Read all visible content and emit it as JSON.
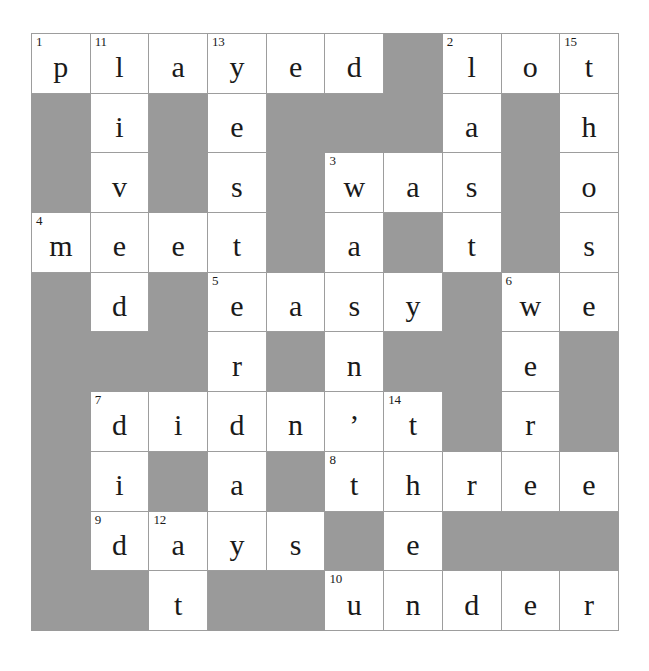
{
  "puzzle": {
    "type": "crossword-grid",
    "rows": 10,
    "cols": 10,
    "colors": {
      "block": "#9a9a9a",
      "cell": "#ffffff",
      "grid_line": "#9d9d9d",
      "text": "#1a1a1a"
    },
    "grid": [
      [
        {
          "block": false,
          "number": "1",
          "letter": "p"
        },
        {
          "block": false,
          "number": "11",
          "letter": "l"
        },
        {
          "block": false,
          "number": "",
          "letter": "a"
        },
        {
          "block": false,
          "number": "13",
          "letter": "y"
        },
        {
          "block": false,
          "number": "",
          "letter": "e"
        },
        {
          "block": false,
          "number": "",
          "letter": "d"
        },
        {
          "block": true,
          "number": "",
          "letter": ""
        },
        {
          "block": false,
          "number": "2",
          "letter": "l"
        },
        {
          "block": false,
          "number": "",
          "letter": "o"
        },
        {
          "block": false,
          "number": "15",
          "letter": "t"
        }
      ],
      [
        {
          "block": true,
          "number": "",
          "letter": ""
        },
        {
          "block": false,
          "number": "",
          "letter": "i"
        },
        {
          "block": true,
          "number": "",
          "letter": ""
        },
        {
          "block": false,
          "number": "",
          "letter": "e"
        },
        {
          "block": true,
          "number": "",
          "letter": ""
        },
        {
          "block": true,
          "number": "",
          "letter": ""
        },
        {
          "block": true,
          "number": "",
          "letter": ""
        },
        {
          "block": false,
          "number": "",
          "letter": "a"
        },
        {
          "block": true,
          "number": "",
          "letter": ""
        },
        {
          "block": false,
          "number": "",
          "letter": "h"
        }
      ],
      [
        {
          "block": true,
          "number": "",
          "letter": ""
        },
        {
          "block": false,
          "number": "",
          "letter": "v"
        },
        {
          "block": true,
          "number": "",
          "letter": ""
        },
        {
          "block": false,
          "number": "",
          "letter": "s"
        },
        {
          "block": true,
          "number": "",
          "letter": ""
        },
        {
          "block": false,
          "number": "3",
          "letter": "w"
        },
        {
          "block": false,
          "number": "",
          "letter": "a"
        },
        {
          "block": false,
          "number": "",
          "letter": "s"
        },
        {
          "block": true,
          "number": "",
          "letter": ""
        },
        {
          "block": false,
          "number": "",
          "letter": "o"
        }
      ],
      [
        {
          "block": false,
          "number": "4",
          "letter": "m"
        },
        {
          "block": false,
          "number": "",
          "letter": "e"
        },
        {
          "block": false,
          "number": "",
          "letter": "e"
        },
        {
          "block": false,
          "number": "",
          "letter": "t"
        },
        {
          "block": true,
          "number": "",
          "letter": ""
        },
        {
          "block": false,
          "number": "",
          "letter": "a"
        },
        {
          "block": true,
          "number": "",
          "letter": ""
        },
        {
          "block": false,
          "number": "",
          "letter": "t"
        },
        {
          "block": true,
          "number": "",
          "letter": ""
        },
        {
          "block": false,
          "number": "",
          "letter": "s"
        }
      ],
      [
        {
          "block": true,
          "number": "",
          "letter": ""
        },
        {
          "block": false,
          "number": "",
          "letter": "d"
        },
        {
          "block": true,
          "number": "",
          "letter": ""
        },
        {
          "block": false,
          "number": "5",
          "letter": "e"
        },
        {
          "block": false,
          "number": "",
          "letter": "a"
        },
        {
          "block": false,
          "number": "",
          "letter": "s"
        },
        {
          "block": false,
          "number": "",
          "letter": "y"
        },
        {
          "block": true,
          "number": "",
          "letter": ""
        },
        {
          "block": false,
          "number": "6",
          "letter": "w"
        },
        {
          "block": false,
          "number": "",
          "letter": "e"
        }
      ],
      [
        {
          "block": true,
          "number": "",
          "letter": ""
        },
        {
          "block": true,
          "number": "",
          "letter": ""
        },
        {
          "block": true,
          "number": "",
          "letter": ""
        },
        {
          "block": false,
          "number": "",
          "letter": "r"
        },
        {
          "block": true,
          "number": "",
          "letter": ""
        },
        {
          "block": false,
          "number": "",
          "letter": "n"
        },
        {
          "block": true,
          "number": "",
          "letter": ""
        },
        {
          "block": true,
          "number": "",
          "letter": ""
        },
        {
          "block": false,
          "number": "",
          "letter": "e"
        },
        {
          "block": true,
          "number": "",
          "letter": ""
        }
      ],
      [
        {
          "block": true,
          "number": "",
          "letter": ""
        },
        {
          "block": false,
          "number": "7",
          "letter": "d"
        },
        {
          "block": false,
          "number": "",
          "letter": "i"
        },
        {
          "block": false,
          "number": "",
          "letter": "d"
        },
        {
          "block": false,
          "number": "",
          "letter": "n"
        },
        {
          "block": false,
          "number": "",
          "letter": "’"
        },
        {
          "block": false,
          "number": "14",
          "letter": "t"
        },
        {
          "block": true,
          "number": "",
          "letter": ""
        },
        {
          "block": false,
          "number": "",
          "letter": "r"
        },
        {
          "block": true,
          "number": "",
          "letter": ""
        }
      ],
      [
        {
          "block": true,
          "number": "",
          "letter": ""
        },
        {
          "block": false,
          "number": "",
          "letter": "i"
        },
        {
          "block": true,
          "number": "",
          "letter": ""
        },
        {
          "block": false,
          "number": "",
          "letter": "a"
        },
        {
          "block": true,
          "number": "",
          "letter": ""
        },
        {
          "block": false,
          "number": "8",
          "letter": "t"
        },
        {
          "block": false,
          "number": "",
          "letter": "h"
        },
        {
          "block": false,
          "number": "",
          "letter": "r"
        },
        {
          "block": false,
          "number": "",
          "letter": "e"
        },
        {
          "block": false,
          "number": "",
          "letter": "e"
        }
      ],
      [
        {
          "block": true,
          "number": "",
          "letter": ""
        },
        {
          "block": false,
          "number": "9",
          "letter": "d"
        },
        {
          "block": false,
          "number": "12",
          "letter": "a"
        },
        {
          "block": false,
          "number": "",
          "letter": "y"
        },
        {
          "block": false,
          "number": "",
          "letter": "s"
        },
        {
          "block": true,
          "number": "",
          "letter": ""
        },
        {
          "block": false,
          "number": "",
          "letter": "e"
        },
        {
          "block": true,
          "number": "",
          "letter": ""
        },
        {
          "block": true,
          "number": "",
          "letter": ""
        },
        {
          "block": true,
          "number": "",
          "letter": ""
        }
      ],
      [
        {
          "block": true,
          "number": "",
          "letter": ""
        },
        {
          "block": true,
          "number": "",
          "letter": ""
        },
        {
          "block": false,
          "number": "",
          "letter": "t"
        },
        {
          "block": true,
          "number": "",
          "letter": ""
        },
        {
          "block": true,
          "number": "",
          "letter": ""
        },
        {
          "block": false,
          "number": "10",
          "letter": "u"
        },
        {
          "block": false,
          "number": "",
          "letter": "n"
        },
        {
          "block": false,
          "number": "",
          "letter": "d"
        },
        {
          "block": false,
          "number": "",
          "letter": "e"
        },
        {
          "block": false,
          "number": "",
          "letter": "r"
        }
      ]
    ]
  }
}
